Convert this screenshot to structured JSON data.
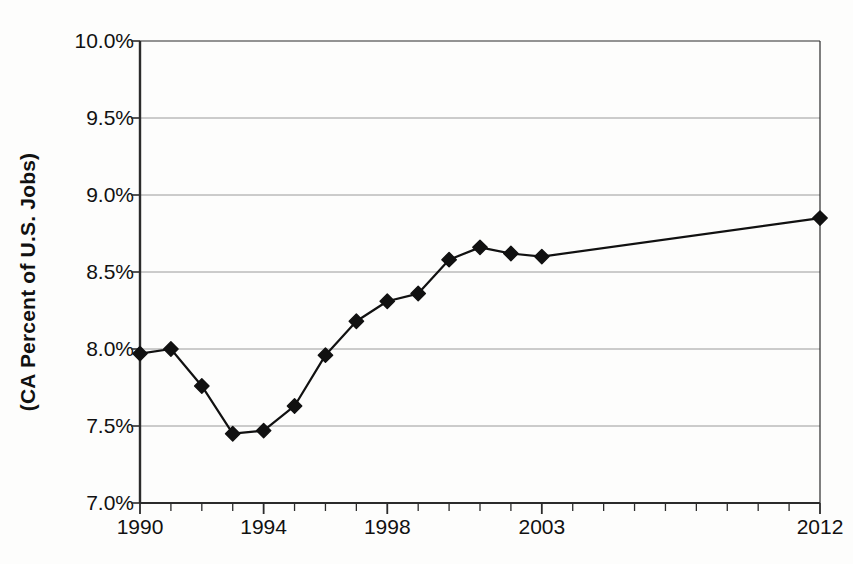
{
  "chart_data": {
    "type": "line",
    "title": "",
    "xlabel": "",
    "ylabel": "(CA Percent of U.S. Jobs)",
    "ylim": [
      7.0,
      10.0
    ],
    "xlim": [
      1990,
      2012
    ],
    "grid": true,
    "legend": false,
    "y_tick_labels": [
      "10.0%",
      "9.5%",
      "9.0%",
      "8.5%",
      "8.0%",
      "7.5%",
      "7.0%"
    ],
    "y_tick_values": [
      10.0,
      9.5,
      9.0,
      8.5,
      8.0,
      7.5,
      7.0
    ],
    "x_tick_labels": [
      "1990",
      "1994",
      "1998",
      "2003",
      "2012"
    ],
    "x_tick_values": [
      1990,
      1994,
      1998,
      2003,
      2012
    ],
    "x_minor_ticks": [
      1990,
      1991,
      1992,
      1993,
      1994,
      1995,
      1996,
      1997,
      1998,
      1999,
      2000,
      2001,
      2002,
      2003,
      2004,
      2005,
      2006,
      2007,
      2008,
      2009,
      2010,
      2011,
      2012
    ],
    "marker": "diamond",
    "marker_color": "#111111",
    "line_color": "#111111",
    "series": [
      {
        "name": "CA Percent of U.S. Jobs",
        "x": [
          1990,
          1991,
          1992,
          1993,
          1994,
          1995,
          1996,
          1997,
          1998,
          1999,
          2000,
          2001,
          2002,
          2003,
          2012
        ],
        "values": [
          7.97,
          8.0,
          7.76,
          7.45,
          7.47,
          7.63,
          7.96,
          8.18,
          8.31,
          8.36,
          8.58,
          8.66,
          8.62,
          8.6,
          8.85
        ]
      }
    ]
  },
  "plot": {
    "left": 140,
    "right": 820,
    "top": 41,
    "bottom": 503
  }
}
